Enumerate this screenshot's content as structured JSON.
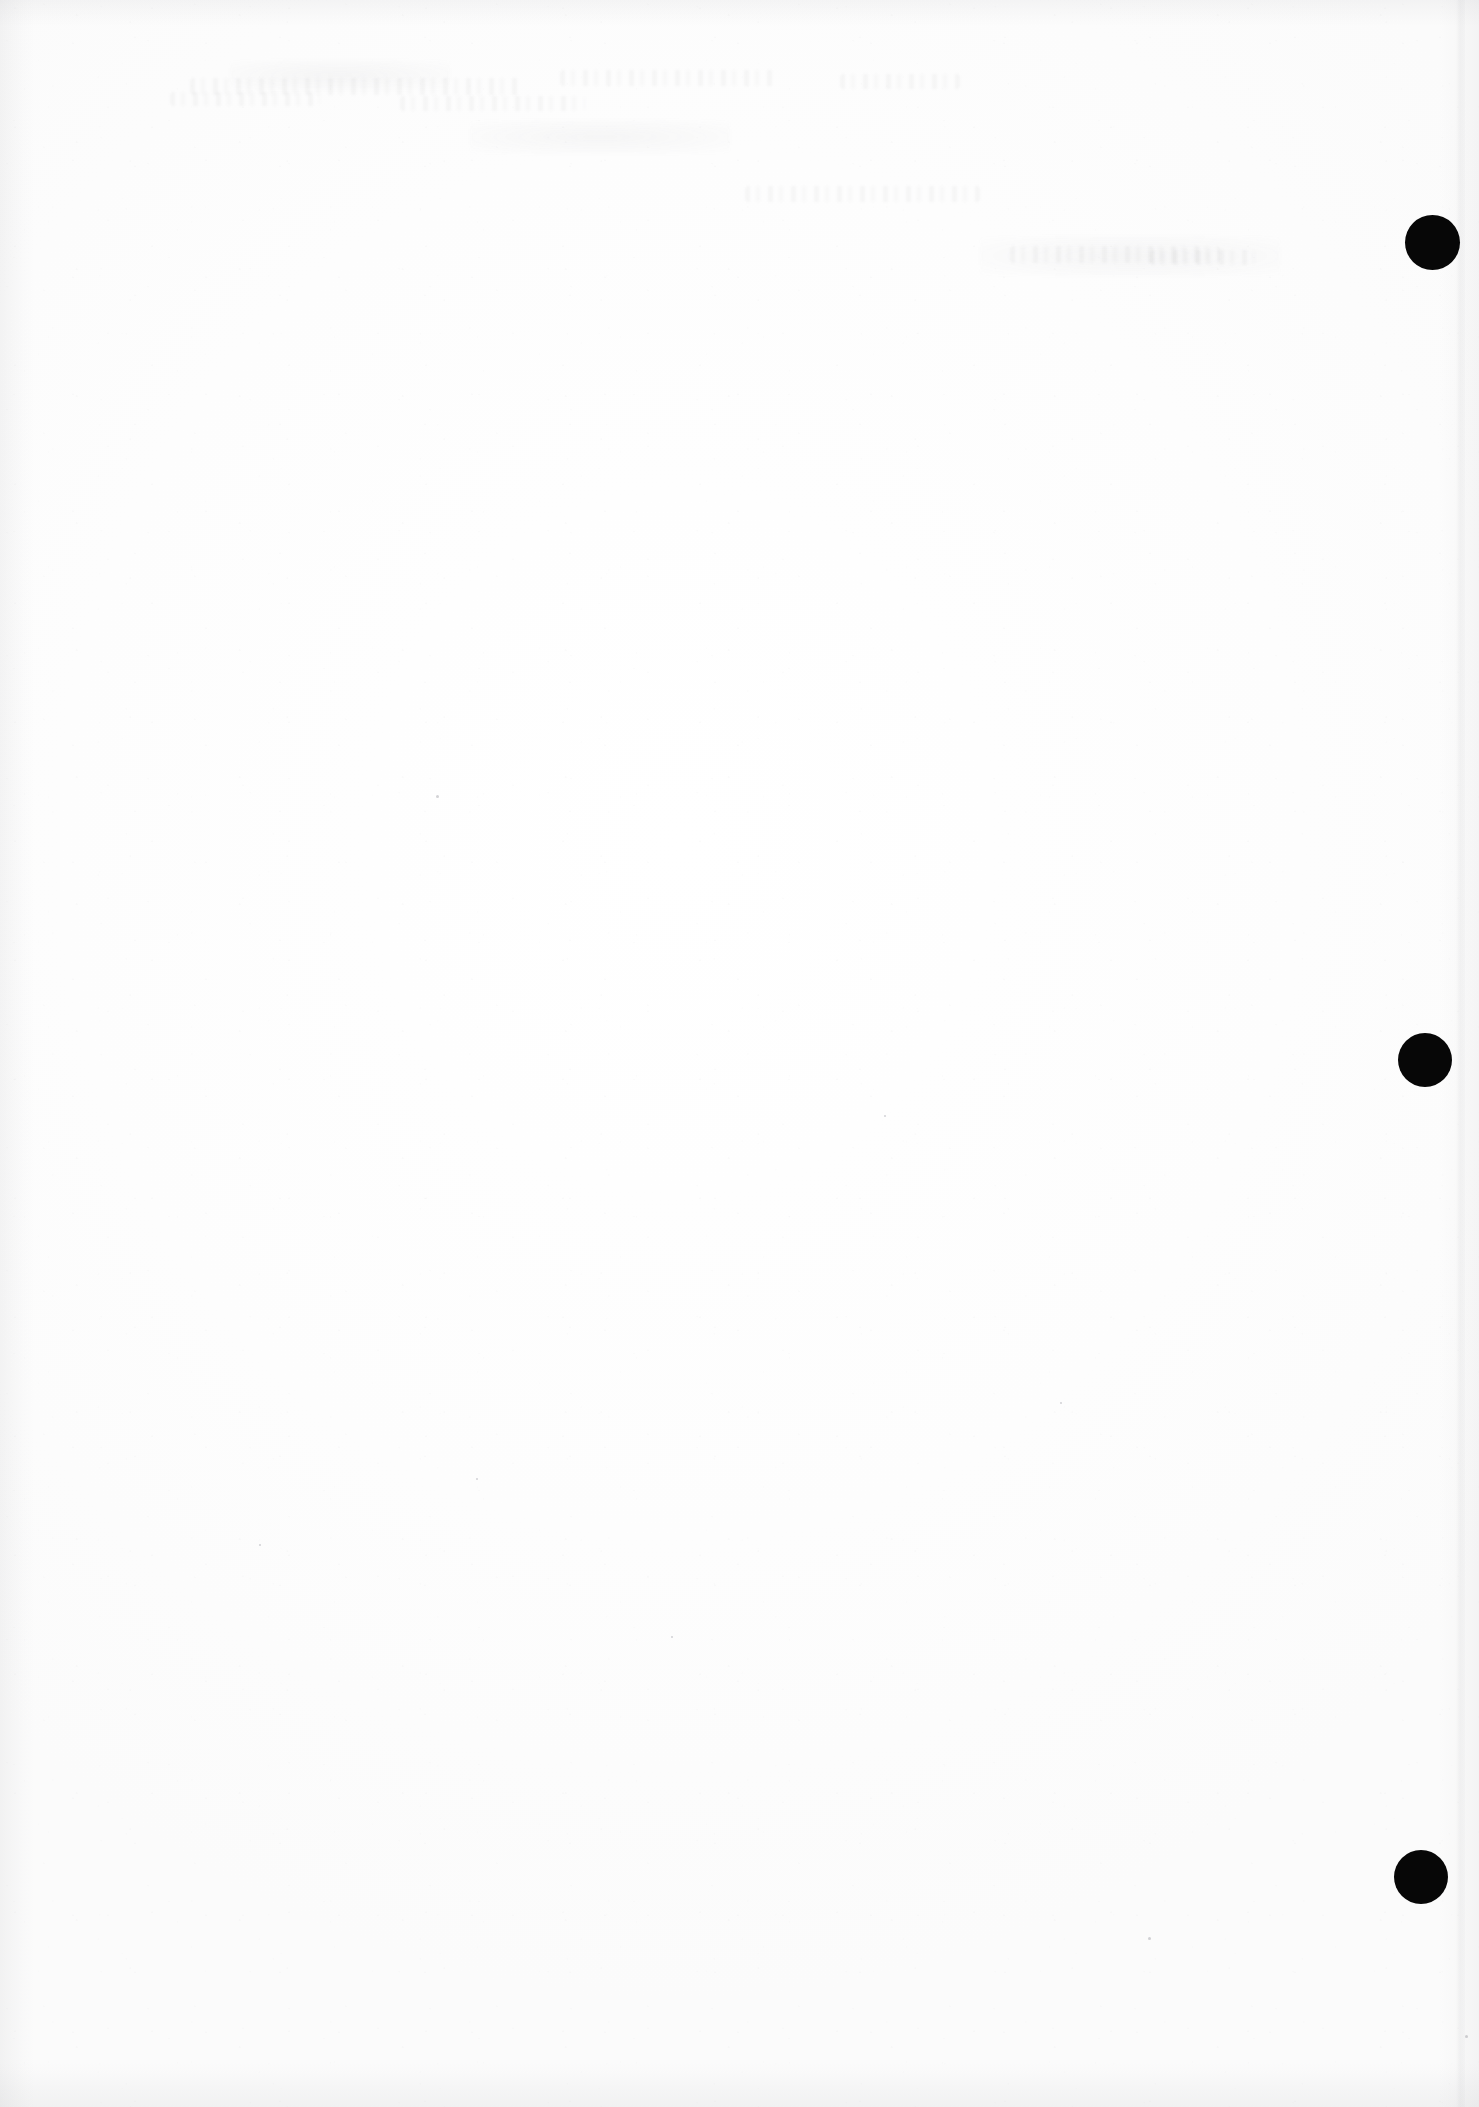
{
  "document": {
    "kind": "scanned-page",
    "title": "Scanned Blank Page",
    "page_width": 1479,
    "page_height": 2107,
    "background_color": "#fefefe",
    "content_text": "",
    "note": "Blank scanned sheet: no legible text, headings, tables or figures are rendered on this page."
  },
  "marks": {
    "label": "registration marks",
    "color": "#070707",
    "count": 3,
    "items": [
      {
        "name": "registration-mark-top",
        "cx": 1432,
        "cy": 242,
        "d": 55
      },
      {
        "name": "registration-mark-middle",
        "cx": 1425,
        "cy": 1060,
        "d": 54
      },
      {
        "name": "registration-mark-bottom",
        "cx": 1421,
        "cy": 1877,
        "d": 54
      }
    ]
  },
  "artifacts": {
    "edge_shadow_color": "#8c8c92",
    "ghost_traces": [
      {
        "name": "ghost-trace-headline-left",
        "x": 190,
        "y": 78,
        "w": 330,
        "h": 17,
        "kind": "band"
      },
      {
        "name": "ghost-trace-headline-mid",
        "x": 560,
        "y": 70,
        "w": 215,
        "h": 16,
        "kind": "band"
      },
      {
        "name": "ghost-trace-headline-right",
        "x": 840,
        "y": 74,
        "w": 120,
        "h": 15,
        "kind": "band"
      },
      {
        "name": "ghost-trace-line-a",
        "x": 170,
        "y": 92,
        "w": 150,
        "h": 14,
        "kind": "band"
      },
      {
        "name": "ghost-trace-line-b",
        "x": 400,
        "y": 96,
        "w": 185,
        "h": 15,
        "kind": "band"
      },
      {
        "name": "ghost-trace-line-c",
        "x": 745,
        "y": 186,
        "w": 235,
        "h": 16,
        "kind": "band"
      },
      {
        "name": "ghost-trace-line-d",
        "x": 1010,
        "y": 246,
        "w": 210,
        "h": 17,
        "kind": "band"
      },
      {
        "name": "ghost-trace-line-e",
        "x": 1150,
        "y": 250,
        "w": 105,
        "h": 15,
        "kind": "band"
      },
      {
        "name": "ghost-trace-blotch-a",
        "x": 470,
        "y": 120,
        "w": 260,
        "h": 34,
        "kind": "blotch"
      },
      {
        "name": "ghost-trace-blotch-b",
        "x": 980,
        "y": 236,
        "w": 300,
        "h": 40,
        "kind": "blotch"
      },
      {
        "name": "ghost-trace-blotch-c",
        "x": 230,
        "y": 60,
        "w": 220,
        "h": 30,
        "kind": "blotch"
      }
    ],
    "specks": [
      {
        "name": "dust-speck",
        "x": 436,
        "y": 795,
        "d": 3
      },
      {
        "name": "dust-speck",
        "x": 884,
        "y": 1115,
        "d": 2
      },
      {
        "name": "dust-speck",
        "x": 476,
        "y": 1478,
        "d": 2
      },
      {
        "name": "dust-speck",
        "x": 1148,
        "y": 1937,
        "d": 3
      },
      {
        "name": "dust-speck",
        "x": 1465,
        "y": 2035,
        "d": 3
      },
      {
        "name": "dust-speck",
        "x": 671,
        "y": 1636,
        "d": 2
      },
      {
        "name": "dust-speck",
        "x": 259,
        "y": 1544,
        "d": 2
      },
      {
        "name": "dust-speck",
        "x": 1060,
        "y": 1402,
        "d": 2
      }
    ]
  }
}
